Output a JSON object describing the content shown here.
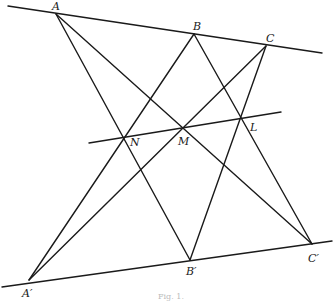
{
  "diagram": {
    "points": {
      "A": {
        "label": "A",
        "x": 56,
        "y": 14
      },
      "B": {
        "label": "B",
        "x": 194,
        "y": 34
      },
      "C": {
        "label": "C",
        "x": 266,
        "y": 46
      },
      "A2": {
        "label": "A′",
        "x": 29,
        "y": 280
      },
      "B2": {
        "label": "B′",
        "x": 190,
        "y": 260
      },
      "C2": {
        "label": "C′",
        "x": 312,
        "y": 244
      },
      "N": {
        "label": "N",
        "x": 124,
        "y": 136
      },
      "M": {
        "label": "M",
        "x": 184,
        "y": 128
      },
      "L": {
        "label": "L",
        "x": 241,
        "y": 118
      }
    },
    "caption": "Fig. 1."
  }
}
